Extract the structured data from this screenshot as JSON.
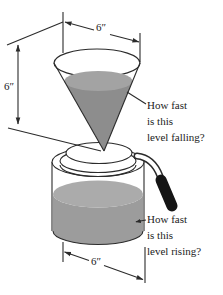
{
  "figure": {
    "labels": {
      "funnel_diameter": "6″",
      "funnel_height": "6″",
      "pot_diameter": "6″"
    },
    "questions": {
      "falling": {
        "lines": [
          "How fast",
          "is this",
          "level falling?"
        ]
      },
      "rising": {
        "lines": [
          "How fast",
          "is this",
          "level rising?"
        ]
      }
    },
    "colors": {
      "outline": "#2b2b2b",
      "funnel_liquid": "#8d8d8d",
      "funnel_liquid_surface": "#a3a3a3",
      "pot_liquid_surface": "#ababab",
      "pot_liquid_front": "#9c9c9c",
      "handle": "#151515",
      "background": "#ffffff"
    }
  }
}
